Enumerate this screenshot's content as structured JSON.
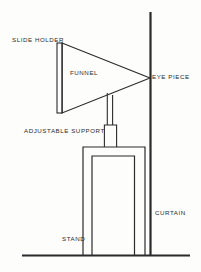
{
  "diagram": {
    "type": "line-drawing",
    "background_color": "#fdfdfc",
    "stroke_color": "#2b2b2b",
    "labels": {
      "slide_holder": "SLIDE HOLDER",
      "funnel": "FUNNEL",
      "eye_piece": "EYE PIECE",
      "adjustable_support": "ADJUSTABLE SUPPORT",
      "curtain": "CURTAIN",
      "stand": "STAND"
    },
    "parts": {
      "slide_holder": {
        "shape": "narrow-vertical-rectangle",
        "x1": 57,
        "x2": 62,
        "y1": 43,
        "y2": 113
      },
      "funnel": {
        "shape": "triangle",
        "points": "62,43 150,78 62,113"
      },
      "eye_piece": {
        "shape": "apex-at-curtain",
        "x": 150,
        "y": 78
      },
      "adjustable_support_tube": {
        "shape": "thin-vertical-tube",
        "x1": 107,
        "x2": 113,
        "y1": 93,
        "y2": 125
      },
      "adjustable_support_collar": {
        "shape": "wider-vertical-tube",
        "x1": 104,
        "x2": 117,
        "y1": 125,
        "y2": 147
      },
      "stand_outer_box": {
        "shape": "rectangle-open-bottom",
        "x1": 83,
        "x2": 145,
        "y1": 147,
        "y2": 255
      },
      "stand_inner_box": {
        "shape": "rectangle-open-bottom",
        "x1": 92,
        "x2": 135,
        "y1": 156,
        "y2": 255
      },
      "curtain": {
        "shape": "thick-vertical-line",
        "x": 150,
        "y1": 12,
        "y2": 255
      },
      "ground_line": {
        "shape": "horizontal-line",
        "x1": 22,
        "x2": 190,
        "y": 255
      }
    }
  }
}
